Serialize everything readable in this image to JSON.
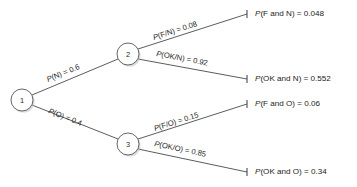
{
  "diagram": {
    "type": "probability-tree",
    "title": "",
    "nodes": [
      {
        "id": "1",
        "label": "1",
        "cx": 22,
        "cy": 100,
        "r": 11
      },
      {
        "id": "2",
        "label": "2",
        "cx": 128,
        "cy": 54,
        "r": 11
      },
      {
        "id": "3",
        "label": "3",
        "cx": 128,
        "cy": 144,
        "r": 11
      }
    ],
    "branches": [
      {
        "id": "branch-n",
        "from": "1",
        "to": "2",
        "prefix": "P",
        "rest": "(N) = 0.6",
        "full_text": "P(N) = 0.6",
        "probability": 0.6,
        "event": "N",
        "x1": 32,
        "y1": 95,
        "x2": 118,
        "y2": 59,
        "label_x": 48,
        "label_y": 82,
        "label_rotation": -22.7
      },
      {
        "id": "branch-o",
        "from": "1",
        "to": "3",
        "prefix": "P",
        "rest": "(O) = 0.4",
        "full_text": "P(O) = 0.4",
        "probability": 0.4,
        "event": "O",
        "x1": 32,
        "y1": 105,
        "x2": 118,
        "y2": 139,
        "label_x": 48,
        "label_y": 113,
        "label_rotation": 21.6
      },
      {
        "id": "branch-f-given-n",
        "from": "2",
        "to": "leaf-f-and-n",
        "prefix": "P",
        "rest": "(F/N) = 0.08",
        "full_text": "P(F/N) = 0.08",
        "probability": 0.08,
        "event": "F/N",
        "x1": 138,
        "y1": 49,
        "x2": 247,
        "y2": 14,
        "label_x": 154,
        "label_y": 40,
        "label_rotation": -17.8
      },
      {
        "id": "branch-ok-given-n",
        "from": "2",
        "to": "leaf-ok-and-n",
        "prefix": "P",
        "rest": "(OK/N) = 0.92",
        "full_text": "P(OK/N) = 0.92",
        "probability": 0.92,
        "event": "OK/N",
        "x1": 138,
        "y1": 59,
        "x2": 247,
        "y2": 79,
        "label_x": 156,
        "label_y": 56,
        "label_rotation": 10.4
      },
      {
        "id": "branch-f-given-o",
        "from": "3",
        "to": "leaf-f-and-o",
        "prefix": "P",
        "rest": "(F/O) = 0.15",
        "full_text": "P(F/O) = 0.15",
        "probability": 0.15,
        "event": "F/O",
        "x1": 138,
        "y1": 139,
        "x2": 247,
        "y2": 104,
        "label_x": 155,
        "label_y": 131,
        "label_rotation": -17.8
      },
      {
        "id": "branch-ok-given-o",
        "from": "3",
        "to": "leaf-ok-and-o",
        "prefix": "P",
        "rest": "(OK/O) = 0.85",
        "full_text": "P(OK/O) = 0.85",
        "probability": 0.85,
        "event": "OK/O",
        "x1": 138,
        "y1": 149,
        "x2": 247,
        "y2": 172,
        "label_x": 154,
        "label_y": 146,
        "label_rotation": 11.9
      }
    ],
    "leaf_ticks": [
      {
        "id": "tick-f-and-n",
        "x": 247,
        "y": 14
      },
      {
        "id": "tick-ok-and-n",
        "x": 247,
        "y": 79
      },
      {
        "id": "tick-f-and-o",
        "x": 247,
        "y": 104
      },
      {
        "id": "tick-ok-and-o",
        "x": 247,
        "y": 172
      }
    ],
    "outcomes": [
      {
        "id": "outcome-f-and-n",
        "prefix": "P",
        "rest": "(F and N) = 0.048",
        "full_text": "P(F and N) = 0.048",
        "value": 0.048,
        "x": 255,
        "y": 10
      },
      {
        "id": "outcome-ok-and-n",
        "prefix": "P",
        "rest": "(OK and N) = 0.552",
        "full_text": "P(OK and N) = 0.552",
        "value": 0.552,
        "x": 255,
        "y": 75
      },
      {
        "id": "outcome-f-and-o",
        "prefix": "P",
        "rest": "(F and O) = 0.06",
        "full_text": "P(F and O) = 0.06",
        "value": 0.06,
        "x": 255,
        "y": 100
      },
      {
        "id": "outcome-ok-and-o",
        "prefix": "P",
        "rest": "(OK and O) = 0.34",
        "full_text": "P(OK and O) = 0.34",
        "value": 0.34,
        "x": 255,
        "y": 168
      }
    ],
    "colors": {
      "line": "#4a4a4a",
      "node_stroke": "#555555",
      "node_fill": "#ffffff",
      "text": "#1d1d1d",
      "background": "#ffffff",
      "shadow": "#bdbdbd"
    }
  }
}
